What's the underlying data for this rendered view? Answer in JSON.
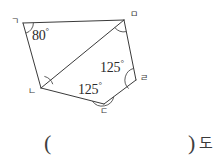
{
  "figure": {
    "type": "polygon-angle-problem",
    "shape_name": "pentagon",
    "stroke_color": "#3a3a3a",
    "vertices": [
      {
        "id": "g",
        "label": "ㄱ",
        "x": 23,
        "y": 23,
        "label_x": 11,
        "label_y": 17
      },
      {
        "id": "m",
        "label": "ㅁ",
        "x": 124,
        "y": 20,
        "label_x": 130,
        "label_y": 10
      },
      {
        "id": "r",
        "label": "ㄹ",
        "x": 136,
        "y": 80,
        "label_x": 140,
        "label_y": 74
      },
      {
        "id": "d",
        "label": "ㄷ",
        "x": 104,
        "y": 104,
        "label_x": 100,
        "label_y": 107
      },
      {
        "id": "n",
        "label": "ㄴ",
        "x": 41,
        "y": 88,
        "label_x": 28,
        "label_y": 87
      }
    ],
    "edges": [
      {
        "from": "g",
        "to": "m"
      },
      {
        "from": "m",
        "to": "r"
      },
      {
        "from": "r",
        "to": "d"
      },
      {
        "from": "d",
        "to": "n"
      },
      {
        "from": "n",
        "to": "g"
      }
    ],
    "diagonals": [
      {
        "from": "n",
        "to": "m"
      }
    ],
    "angle_labels": [
      {
        "at_vertex": "g",
        "value": "80",
        "unit": "°",
        "x": 32,
        "y": 29
      },
      {
        "at_vertex": "r",
        "value": "125",
        "unit": "°",
        "x": 100,
        "y": 61
      },
      {
        "at_vertex": "d",
        "value": "125",
        "unit": "°",
        "x": 78,
        "y": 83
      }
    ],
    "angle_arcs": [
      {
        "at_vertex": "g",
        "marked": true
      },
      {
        "at_vertex": "m",
        "marked": true
      },
      {
        "at_vertex": "r",
        "marked": true
      },
      {
        "at_vertex": "d",
        "marked": true
      },
      {
        "at_vertex": "n",
        "marked": true
      }
    ]
  },
  "answer": {
    "open_paren": "(",
    "close_paren": ")",
    "unit": "도",
    "value": ""
  }
}
